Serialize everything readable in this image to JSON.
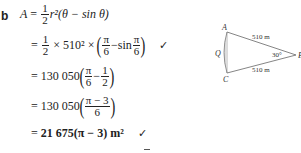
{
  "solution": {
    "part_label": "b",
    "lines": [
      {
        "lhs": "A",
        "eq": "=",
        "frac_num": "1",
        "frac_den": "2",
        "rest": "r²(θ − sin θ)"
      },
      {
        "eq": "=",
        "frac_num": "1",
        "frac_den": "2",
        "mid": "× 510² ×",
        "inner_frac1_num": "π",
        "inner_frac1_den": "6",
        "minus_sin": "−sin",
        "inner_frac2_num": "π",
        "inner_frac2_den": "6",
        "mark": "✓"
      },
      {
        "eq": "=",
        "coef": "130 050",
        "inner_frac1_num": "π",
        "inner_frac1_den": "6",
        "minus": "−",
        "inner_frac2_num": "1",
        "inner_frac2_den": "2"
      },
      {
        "eq": "=",
        "coef": "130 050",
        "inner_frac_num": "π − 3",
        "inner_frac_den": "6"
      },
      {
        "eq": "=",
        "result": "21 675(π − 3) m²",
        "mark": "✓"
      }
    ]
  },
  "diagram": {
    "vertex_top": "A",
    "vertex_bottom": "C",
    "vertex_apex": "B",
    "arc_point": "Q",
    "side_top_label": "510 m",
    "side_bottom_label": "510 m",
    "angle_label": "30°"
  }
}
